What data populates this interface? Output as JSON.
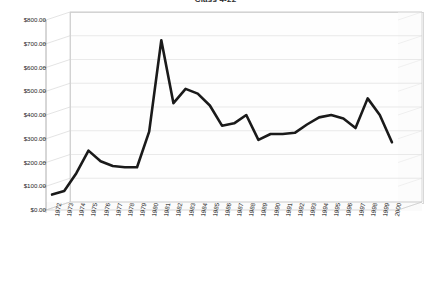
{
  "chart_data": {
    "type": "line",
    "title": "Class 4-22",
    "xlabel": "",
    "ylabel": "",
    "ylim": [
      0,
      800
    ],
    "ytick_step": 100,
    "ytick_labels": [
      "$800.00",
      "$700.00",
      "$600.00",
      "$500.00",
      "$400.00",
      "$300.00",
      "$200.00",
      "$100.00",
      "$0.00"
    ],
    "ytick_values": [
      800,
      700,
      600,
      500,
      400,
      300,
      200,
      100,
      0
    ],
    "grid": true,
    "legend": "none",
    "style_3d": true,
    "line_color": "#1a1a1a",
    "categories": [
      "1972",
      "1973",
      "1974",
      "1975",
      "1976",
      "1977",
      "1978",
      "1979",
      "1980",
      "1981",
      "1982",
      "1983",
      "1984",
      "1985",
      "1986",
      "1987",
      "1988",
      "1989",
      "1990",
      "1991",
      "1992",
      "1993",
      "1994",
      "1995",
      "1996",
      "1997",
      "1998",
      "1999",
      "2000"
    ],
    "series": [
      {
        "name": "Value",
        "values": [
          65,
          80,
          155,
          250,
          205,
          185,
          180,
          180,
          330,
          715,
          450,
          510,
          490,
          440,
          355,
          365,
          400,
          295,
          320,
          320,
          325,
          360,
          390,
          400,
          385,
          345,
          470,
          400,
          285
        ]
      }
    ]
  },
  "axes": {
    "y_axis_name": "dollar-amount-axis",
    "x_axis_name": "year-axis"
  }
}
